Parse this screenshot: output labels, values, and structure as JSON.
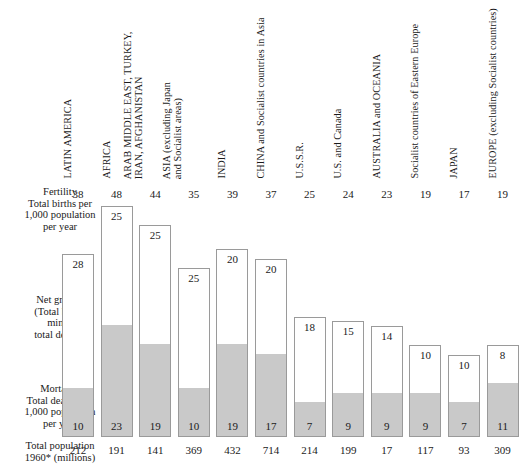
{
  "chart_data": {
    "type": "bar",
    "title": "",
    "subtitle": "",
    "xlabel": "",
    "ylabel": "",
    "stacked": true,
    "ylim": [
      0,
      48
    ],
    "grid": false,
    "legend_position": "none",
    "units": "per 1,000 population per year",
    "categories": [
      "LATIN AMERICA",
      "AFRICA",
      "ARAB MIDDLE EAST, TURKEY, IRAN, AFGHANISTAN",
      "ASIA (excluding Japan and Socialist areas)",
      "INDIA",
      "CHINA and Socialist countries in Asia",
      "U.S.S.R.",
      "U.S. and Canada",
      "AUSTRALIA and OCEANIA",
      "Socialist countries of Eastern Europe",
      "JAPAN",
      "EUROPE (excluding Socialist countries)"
    ],
    "series": [
      {
        "name": "Fertility (total births per 1,000 population per year)",
        "values": [
          38,
          48,
          44,
          35,
          39,
          37,
          25,
          24,
          23,
          19,
          17,
          19
        ]
      },
      {
        "name": "Net growth (total births minus total deaths)",
        "values": [
          28,
          25,
          25,
          25,
          20,
          20,
          18,
          15,
          14,
          10,
          10,
          8
        ]
      },
      {
        "name": "Mortality (total deaths per 1,000 population per year)",
        "values": [
          10,
          23,
          19,
          10,
          19,
          17,
          7,
          9,
          9,
          9,
          7,
          11
        ]
      },
      {
        "name": "Total population 1960 (millions)",
        "values": [
          212,
          191,
          141,
          369,
          432,
          714,
          214,
          199,
          17,
          117,
          93,
          309
        ]
      }
    ],
    "colors": {
      "net_growth_fill": "#ffffff",
      "mortality_fill": "#c9c9c9",
      "bar_outline": "#9a9a9a",
      "text": "#1a1a1a",
      "background": "#ffffff"
    }
  },
  "row_labels": {
    "fertility": {
      "lead": "Fertility",
      "line2": "Total births per",
      "line3": "1,000 population",
      "line4": "per year"
    },
    "net_growth": {
      "lead": "Net growth",
      "line2": "(Total births",
      "line3": "minus",
      "line4": "total deaths)"
    },
    "mortality": {
      "lead": "Mortality",
      "line2": "Total deaths per",
      "line3": "1,000 population",
      "line4": "per year"
    },
    "total_population": {
      "lead": "Total population",
      "line2": "1960*  (millions)"
    }
  },
  "columns": [
    {
      "label_line1": "LATIN AMERICA",
      "label_line2": "",
      "fertility": "38",
      "net_growth": "28",
      "mortality": "10",
      "population": "212"
    },
    {
      "label_line1": "AFRICA",
      "label_line2": "",
      "fertility": "48",
      "net_growth": "25",
      "mortality": "23",
      "population": "191"
    },
    {
      "label_line1": "ARAB MIDDLE EAST, TURKEY,",
      "label_line2": "IRAN, AFGHANISTAN",
      "fertility": "44",
      "net_growth": "25",
      "mortality": "19",
      "population": "141"
    },
    {
      "label_line1": "ASIA  (excluding Japan",
      "label_line2": "and Socialist areas)",
      "fertility": "35",
      "net_growth": "25",
      "mortality": "10",
      "population": "369"
    },
    {
      "label_line1": "INDIA",
      "label_line2": "",
      "fertility": "39",
      "net_growth": "20",
      "mortality": "19",
      "population": "432"
    },
    {
      "label_line1": "CHINA and Socialist countries in Asia",
      "label_line2": "",
      "fertility": "37",
      "net_growth": "20",
      "mortality": "17",
      "population": "714"
    },
    {
      "label_line1": "U.S.S.R.",
      "label_line2": "",
      "fertility": "25",
      "net_growth": "18",
      "mortality": "7",
      "population": "214"
    },
    {
      "label_line1": "U.S. and Canada",
      "label_line2": "",
      "fertility": "24",
      "net_growth": "15",
      "mortality": "9",
      "population": "199"
    },
    {
      "label_line1": "AUSTRALIA and OCEANIA",
      "label_line2": "",
      "fertility": "23",
      "net_growth": "14",
      "mortality": "9",
      "population": "17"
    },
    {
      "label_line1": "Socialist countries of Eastern Europe",
      "label_line2": "",
      "fertility": "19",
      "net_growth": "10",
      "mortality": "9",
      "population": "117"
    },
    {
      "label_line1": "JAPAN",
      "label_line2": "",
      "fertility": "17",
      "net_growth": "10",
      "mortality": "7",
      "population": "93"
    },
    {
      "label_line1": "EUROPE  (excluding Socialist countries)",
      "label_line2": "",
      "fertility": "19",
      "net_growth": "8",
      "mortality": "11",
      "population": "309"
    }
  ],
  "layout": {
    "px_per_unit": 4.82,
    "baseline_y": 437,
    "first_col_x": 60,
    "col_pitch": 38.6
  }
}
